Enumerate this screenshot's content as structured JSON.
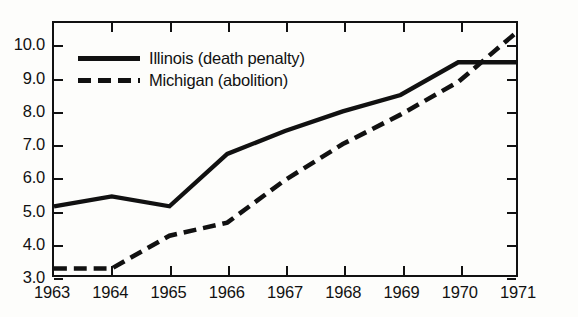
{
  "chart_data": {
    "type": "line",
    "title": "",
    "xlabel": "",
    "ylabel": "",
    "x": [
      1963,
      1964,
      1965,
      1966,
      1967,
      1968,
      1969,
      1970,
      1971
    ],
    "xtick_labels": [
      "1963",
      "1964",
      "1965",
      "1966",
      "1967",
      "1968",
      "1969",
      "1970",
      "1971"
    ],
    "ytick_labels": [
      "3.0",
      "4.0",
      "5.0",
      "6.0",
      "7.0",
      "8.0",
      "9.0",
      "10.0"
    ],
    "ytick_values": [
      3.0,
      4.0,
      5.0,
      6.0,
      7.0,
      8.0,
      9.0,
      10.0
    ],
    "xlim": [
      1963,
      1971
    ],
    "ylim": [
      3.0,
      10.7
    ],
    "grid": false,
    "legend_position": "upper-left-inside",
    "series": [
      {
        "name": "Illinois (death penalty)",
        "style": "solid",
        "color": "#111111",
        "values": [
          5.1,
          5.4,
          5.1,
          6.7,
          7.4,
          8.0,
          8.5,
          9.5,
          9.5
        ]
      },
      {
        "name": "Michigan (abolition)",
        "style": "dashed",
        "color": "#111111",
        "values": [
          3.2,
          3.2,
          4.2,
          4.6,
          5.9,
          7.0,
          7.9,
          8.9,
          10.4
        ]
      }
    ]
  },
  "legend": {
    "items": [
      {
        "label": "Illinois (death penalty)",
        "style": "solid"
      },
      {
        "label": "Michigan (abolition)",
        "style": "dashed"
      }
    ]
  },
  "colors": {
    "ink": "#111111",
    "background": "#fdfdfb"
  }
}
